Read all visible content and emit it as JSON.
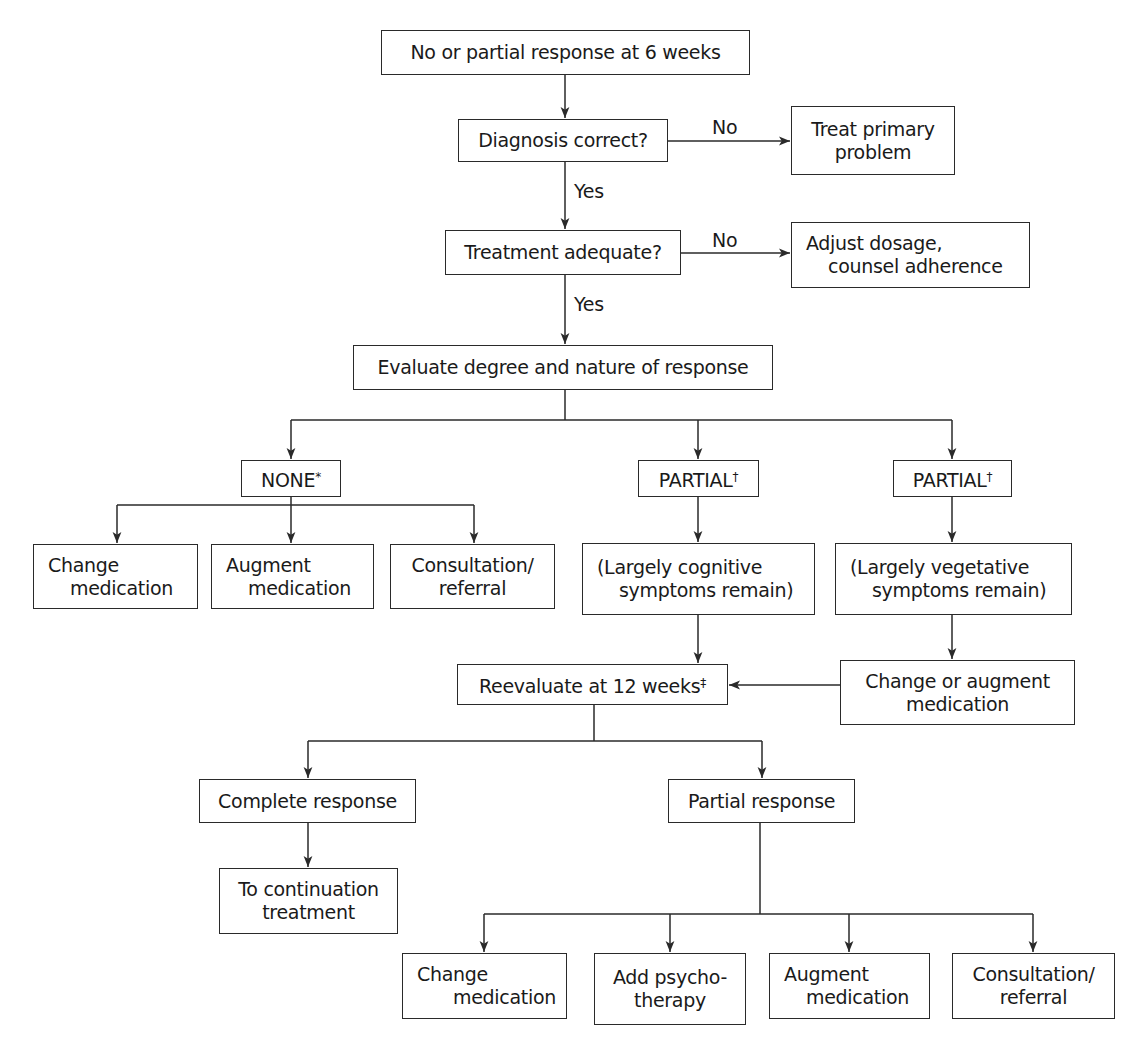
{
  "flowchart": {
    "start": {
      "text": "No or partial response at 6 weeks"
    },
    "diagnosis": {
      "text": "Diagnosis correct?",
      "no_label": "No",
      "yes_label": "Yes"
    },
    "treat_primary": {
      "line1": "Treat primary",
      "line2": "problem"
    },
    "treatment": {
      "text": "Treatment adequate?",
      "no_label": "No",
      "yes_label": "Yes"
    },
    "adjust": {
      "line1": "Adjust dosage,",
      "line2": "counsel adherence"
    },
    "evaluate": {
      "text": "Evaluate degree and nature of response"
    },
    "none": {
      "text": "NONE",
      "mark": "*"
    },
    "partial_cognitive": {
      "text": "PARTIAL",
      "mark": "†"
    },
    "partial_vegetative": {
      "text": "PARTIAL",
      "mark": "†"
    },
    "none_options": [
      {
        "line1": "Change",
        "line2": "medication"
      },
      {
        "line1": "Augment",
        "line2": "medication"
      },
      {
        "line1": "Consultation/",
        "line2": "referral"
      }
    ],
    "cognitive": {
      "line1": "(Largely cognitive",
      "line2": "symptoms remain)"
    },
    "vegetative": {
      "line1": "(Largely vegetative",
      "line2": "symptoms remain)"
    },
    "change_or_augment": {
      "line1": "Change or augment",
      "line2": "medication"
    },
    "reevaluate": {
      "text": "Reevaluate at 12 weeks",
      "mark": "‡"
    },
    "complete_response": {
      "text": "Complete response"
    },
    "continuation": {
      "line1": "To continuation",
      "line2": "treatment"
    },
    "partial_response": {
      "text": "Partial response"
    },
    "partial_options": [
      {
        "line1": "Change",
        "line2": "medication"
      },
      {
        "line1": "Add psycho-",
        "line2": "therapy"
      },
      {
        "line1": "Augment",
        "line2": "medication"
      },
      {
        "line1": "Consultation/",
        "line2": "referral"
      }
    ]
  },
  "colors": {
    "stroke": "#2a2a2a",
    "background": "#ffffff",
    "text": "#1a1a1a"
  }
}
